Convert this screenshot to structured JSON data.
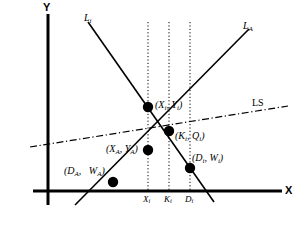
{
  "figure": {
    "kind": "economics-line-diagram",
    "background_color": "#ffffff",
    "ink_color": "#000000"
  },
  "axes": {
    "y_label": "Y",
    "x_label": "X",
    "origin": {
      "x": 48,
      "y": 191
    },
    "y_top": 14,
    "x_right": 282
  },
  "lines": [
    {
      "name": "L-sub-i",
      "label_text": "L",
      "label_sub": "i",
      "style": "solid",
      "direction": "downward-sloping",
      "x1": 88,
      "y1": 22,
      "x2": 214,
      "y2": 202
    },
    {
      "name": "L-sub-A",
      "label_text": "L",
      "label_sub": "A",
      "style": "solid",
      "direction": "upward-sloping",
      "x1": 75,
      "y1": 205,
      "x2": 249,
      "y2": 29
    },
    {
      "name": "LS",
      "label_text": "LS",
      "label_sub": "",
      "style": "dash-dot",
      "direction": "gently-upward",
      "x1": 30,
      "y1": 147,
      "x2": 288,
      "y2": 106
    }
  ],
  "vertical_guides": [
    {
      "name": "guide-Xi",
      "x": 148,
      "y_top": 22,
      "y_bottom": 191
    },
    {
      "name": "guide-Ki",
      "x": 169,
      "y_top": 22,
      "y_bottom": 191
    },
    {
      "name": "guide-Di",
      "x": 190,
      "y_top": 22,
      "y_bottom": 191
    }
  ],
  "x_ticks": [
    {
      "name": "tick-Xi",
      "text": "X",
      "sub": "i",
      "x": 148
    },
    {
      "name": "tick-Ki",
      "text": "K",
      "sub": "i",
      "x": 169
    },
    {
      "name": "tick-Di",
      "text": "D",
      "sub": "i",
      "x": 190
    }
  ],
  "points": [
    {
      "name": "point-Xi-Yi",
      "cx": 148,
      "cy": 107,
      "label_open": "(",
      "v1": "X",
      "v1sub": "i",
      "sep": ",  ",
      "v2": "Y",
      "v2sub": "i",
      "label_close": ")",
      "label_x": 155,
      "label_y": 100
    },
    {
      "name": "point-Ki-Qi",
      "cx": 169,
      "cy": 131,
      "label_open": "(",
      "v1": "K",
      "v1sub": "i",
      "sep": ",  ",
      "v2": "Q",
      "v2sub": "i",
      "label_close": ")",
      "label_x": 175,
      "label_y": 131
    },
    {
      "name": "point-XA-YA",
      "cx": 148,
      "cy": 150,
      "label_open": "(",
      "v1": "X",
      "v1sub": "A",
      "sep": ",  ",
      "v2": "Y",
      "v2sub": "A",
      "label_close": ")",
      "label_x": 106,
      "label_y": 144
    },
    {
      "name": "point-Di-Wi",
      "cx": 190,
      "cy": 168,
      "label_open": "(",
      "v1": "D",
      "v1sub": "i",
      "sep": ",  ",
      "v2": "W",
      "v2sub": "i",
      "label_close": ")",
      "label_x": 192,
      "label_y": 153
    },
    {
      "name": "point-DA-WA",
      "cx": 113,
      "cy": 182,
      "label_open": "(",
      "v1": "D",
      "v1sub": "A",
      "sep": ",   ",
      "v2": "W",
      "v2sub": "A",
      "label_close": ")",
      "label_x": 64,
      "label_y": 166
    }
  ]
}
